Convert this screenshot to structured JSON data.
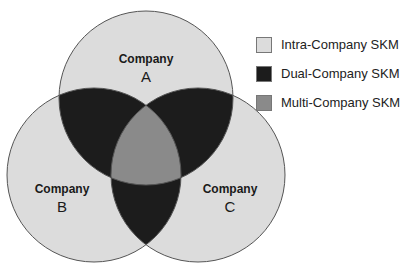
{
  "circles": [
    {
      "id": "A",
      "title": "Company",
      "letter": "A"
    },
    {
      "id": "B",
      "title": "Company",
      "letter": "B"
    },
    {
      "id": "C",
      "title": "Company",
      "letter": "C"
    }
  ],
  "legend": [
    {
      "label": "Intra-Company SKM",
      "color": "#dcdcdc"
    },
    {
      "label": "Dual-Company SKM",
      "color": "#1c1c1c"
    },
    {
      "label": "Multi-Company SKM",
      "color": "#8a8a8a"
    }
  ],
  "colors": {
    "single": "#dcdcdc",
    "dual": "#1c1c1c",
    "triple": "#8a8a8a",
    "stroke": "#555555"
  }
}
